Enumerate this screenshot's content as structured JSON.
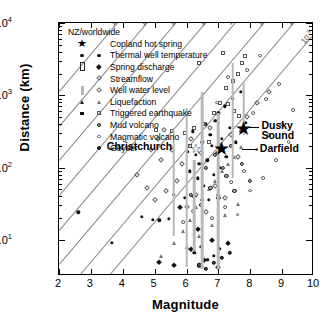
{
  "chart_data": {
    "type": "scatter",
    "title": "",
    "xlabel": "Magnitude",
    "ylabel": "Distance (km)",
    "xlim": [
      2,
      10
    ],
    "ylim_log": [
      0.5,
      4
    ],
    "xscale": "linear",
    "yscale": "log",
    "xticks": [
      "2",
      "3",
      "4",
      "5",
      "6",
      "7",
      "8",
      "9",
      "10"
    ],
    "yticks": [
      "10¹",
      "10²",
      "10³",
      "10⁴"
    ],
    "ytick_exponents": [
      1,
      2,
      3,
      4
    ],
    "grid": false,
    "legend_position": "top-left",
    "legend_title": "NZ/worldwide",
    "legend": [
      {
        "label": "Copland hot spring",
        "nz": "star-filled",
        "world": ""
      },
      {
        "label": "Thermal well temperature",
        "nz": "circle-filled",
        "world": "circle-small-filled"
      },
      {
        "label": "Spring discharge",
        "nz": "bar-open",
        "world": "diamond-filled"
      },
      {
        "label": "Streamflow",
        "nz": "",
        "world": "diamond-open"
      },
      {
        "label": "Well water level",
        "nz": "vertical-bar",
        "world": "diamond-open-light"
      },
      {
        "label": "Liquefaction",
        "nz": "triangle-filled",
        "world": "triangle-open"
      },
      {
        "label": "Triggered earthquake",
        "nz": "square-filled",
        "world": "square-open"
      },
      {
        "label": "Mud volcano",
        "nz": "",
        "world": "circle-shaded"
      },
      {
        "label": "Magmatic volcano",
        "nz": "",
        "world": "circle-open"
      },
      {
        "label": "Geyser",
        "nz": "",
        "world": "circle-dark"
      }
    ],
    "annotations": [
      {
        "text": "Christchurch",
        "x": 5.55,
        "y_log": 2.28,
        "leader": false
      },
      {
        "text": "Dusky Sound",
        "x": 8.35,
        "y_log": 2.55,
        "leader": true
      },
      {
        "text": "Darfield",
        "x": 8.3,
        "y_log": 2.26,
        "leader": true
      }
    ],
    "contour_lines": {
      "description": "Diagonal seismic strain contours, labelled by strain amplitude",
      "labels": [
        "10⁴",
        "10³",
        "10²",
        "10¹",
        "1",
        "10⁻¹",
        "10⁻²",
        "10⁻³"
      ],
      "slope": "log10(distance) increases ~0.52 per magnitude unit"
    },
    "named_events": [
      {
        "name": "Dusky Sound",
        "magnitude": 7.8,
        "distance_km": 340,
        "marker": "star-filled"
      },
      {
        "name": "Darfield",
        "magnitude": 7.1,
        "distance_km": 180,
        "marker": "star-filled"
      },
      {
        "name": "Christchurch",
        "magnitude": 6.3,
        "distance_km": 180,
        "marker": "star-open"
      }
    ],
    "series": [
      {
        "name": "Thermal well temperature",
        "marker": "circle-filled",
        "points": [
          [
            2.6,
            1.38
          ],
          [
            3.65,
            0.96
          ],
          [
            4.6,
            1.32
          ],
          [
            4.95,
            1.28
          ],
          [
            5.15,
            1.27
          ],
          [
            5.45,
            1.29
          ],
          [
            5.6,
            1.62
          ],
          [
            5.95,
            1.58
          ],
          [
            6.05,
            2.22
          ],
          [
            6.1,
            1.95
          ],
          [
            6.2,
            2.5
          ],
          [
            6.3,
            2.18
          ],
          [
            6.35,
            1.85
          ],
          [
            6.4,
            2.05
          ],
          [
            6.5,
            2.35
          ],
          [
            6.55,
            1.75
          ],
          [
            6.6,
            2.6
          ],
          [
            6.65,
            2.1
          ],
          [
            6.7,
            1.55
          ],
          [
            6.75,
            2.45
          ],
          [
            6.8,
            2.3
          ],
          [
            6.85,
            1.9
          ],
          [
            6.9,
            2.65
          ],
          [
            6.95,
            2.2
          ],
          [
            7.0,
            2.75
          ],
          [
            7.05,
            2.0
          ],
          [
            7.1,
            2.4
          ],
          [
            7.2,
            2.85
          ],
          [
            7.25,
            2.15
          ],
          [
            7.35,
            2.55
          ],
          [
            7.45,
            2.95
          ],
          [
            7.55,
            2.35
          ],
          [
            7.7,
            3.05
          ],
          [
            7.85,
            2.62
          ],
          [
            6.25,
            0.82
          ],
          [
            6.45,
            0.9
          ],
          [
            6.65,
            0.72
          ],
          [
            6.85,
            0.78
          ],
          [
            7.05,
            0.88
          ]
        ]
      },
      {
        "name": "Streamflow",
        "marker": "diamond-open",
        "points": [
          [
            4.45,
            1.9
          ],
          [
            4.75,
            1.72
          ],
          [
            5.0,
            1.55
          ],
          [
            5.2,
            2.1
          ],
          [
            5.35,
            1.68
          ],
          [
            5.55,
            2.25
          ],
          [
            5.7,
            1.82
          ],
          [
            5.85,
            2.05
          ],
          [
            6.0,
            1.45
          ],
          [
            6.15,
            2.4
          ],
          [
            6.3,
            1.62
          ],
          [
            6.45,
            2.2
          ],
          [
            6.6,
            1.38
          ],
          [
            6.75,
            2.55
          ],
          [
            6.9,
            1.75
          ],
          [
            7.05,
            2.3
          ],
          [
            7.2,
            1.58
          ],
          [
            7.4,
            2.45
          ],
          [
            7.6,
            2.15
          ],
          [
            7.9,
            2.7
          ],
          [
            8.2,
            2.9
          ],
          [
            8.6,
            3.05
          ],
          [
            5.1,
            2.4
          ],
          [
            4.9,
            2.25
          ],
          [
            5.3,
            2.52
          ]
        ]
      },
      {
        "name": "Magmatic volcano",
        "marker": "circle-open",
        "points": [
          [
            5.9,
            1.25
          ],
          [
            6.2,
            1.4
          ],
          [
            6.5,
            1.55
          ],
          [
            6.8,
            1.3
          ],
          [
            7.0,
            1.62
          ],
          [
            7.2,
            1.45
          ],
          [
            7.4,
            1.8
          ],
          [
            7.6,
            1.35
          ],
          [
            7.8,
            1.95
          ],
          [
            8.0,
            1.68
          ],
          [
            8.2,
            2.25
          ],
          [
            8.4,
            1.85
          ],
          [
            8.6,
            2.45
          ],
          [
            8.8,
            2.1
          ],
          [
            9.0,
            2.6
          ],
          [
            9.2,
            2.35
          ],
          [
            8.1,
            2.75
          ],
          [
            8.5,
            2.95
          ],
          [
            8.9,
            3.15
          ],
          [
            7.9,
            3.35
          ],
          [
            8.3,
            3.55
          ],
          [
            7.3,
            3.25
          ],
          [
            7.7,
            2.5
          ],
          [
            6.95,
            2.9
          ],
          [
            9.35,
            2.8
          ]
        ]
      },
      {
        "name": "Triggered earthquake",
        "marker": "square-open",
        "points": [
          [
            5.05,
            2.52
          ],
          [
            5.55,
            2.5
          ],
          [
            5.95,
            2.48
          ],
          [
            6.25,
            2.55
          ],
          [
            6.55,
            2.6
          ],
          [
            6.85,
            2.75
          ],
          [
            7.05,
            2.9
          ],
          [
            7.25,
            3.1
          ],
          [
            7.45,
            3.2
          ],
          [
            7.6,
            3.3
          ],
          [
            7.75,
            3.45
          ],
          [
            7.85,
            3.55
          ],
          [
            6.4,
            3.45
          ],
          [
            7.15,
            3.58
          ],
          [
            7.3,
            2.88
          ],
          [
            7.5,
            2.78
          ],
          [
            7.65,
            2.72
          ],
          [
            6.7,
            2.35
          ],
          [
            6.1,
            2.3
          ]
        ]
      },
      {
        "name": "Liquefaction",
        "marker": "triangle-open",
        "points": [
          [
            5.2,
            0.78
          ],
          [
            5.6,
            0.95
          ],
          [
            5.9,
            1.12
          ],
          [
            6.1,
            1.28
          ],
          [
            6.3,
            1.45
          ],
          [
            6.5,
            1.58
          ],
          [
            6.7,
            1.7
          ],
          [
            6.9,
            1.82
          ],
          [
            7.1,
            1.95
          ],
          [
            7.3,
            2.05
          ],
          [
            7.5,
            2.15
          ],
          [
            7.7,
            2.28
          ],
          [
            6.0,
            0.9
          ],
          [
            6.4,
            1.05
          ],
          [
            6.8,
            1.2
          ],
          [
            7.2,
            1.35
          ],
          [
            7.6,
            1.5
          ]
        ]
      },
      {
        "name": "Mud volcano",
        "marker": "circle-shaded",
        "points": [
          [
            6.15,
            1.62
          ],
          [
            6.45,
            1.48
          ],
          [
            6.75,
            1.72
          ],
          [
            7.0,
            1.58
          ],
          [
            7.25,
            1.88
          ],
          [
            7.5,
            1.68
          ],
          [
            7.75,
            2.05
          ],
          [
            8.0,
            1.82
          ],
          [
            6.6,
            2.0
          ],
          [
            6.9,
            2.18
          ],
          [
            7.15,
            2.0
          ],
          [
            7.4,
            2.3
          ]
        ]
      },
      {
        "name": "Spring discharge",
        "marker": "diamond-filled",
        "points": [
          [
            5.15,
            0.7
          ],
          [
            5.6,
            0.65
          ],
          [
            6.15,
            0.88
          ],
          [
            6.35,
            1.15
          ],
          [
            6.55,
            0.72
          ],
          [
            6.8,
            1.0
          ],
          [
            7.0,
            0.62
          ],
          [
            6.25,
            1.6
          ],
          [
            5.8,
            1.45
          ],
          [
            7.3,
            0.95
          ]
        ]
      },
      {
        "name": "Geyser",
        "marker": "circle-dark",
        "points": [
          [
            6.6,
            0.6
          ],
          [
            6.85,
            0.68
          ],
          [
            7.1,
            0.75
          ],
          [
            7.35,
            0.82
          ],
          [
            6.4,
            0.65
          ]
        ]
      },
      {
        "name": "Well water level (bars)",
        "marker": "vertical-bar",
        "bars": [
          [
            5.6,
            1.05,
            2.55
          ],
          [
            6.0,
            0.62,
            2.82
          ],
          [
            6.5,
            0.6,
            3.05
          ],
          [
            7.0,
            0.6,
            2.75
          ],
          [
            7.45,
            1.85,
            3.45
          ],
          [
            7.8,
            2.45,
            3.2
          ],
          [
            6.25,
            0.85,
            2.1
          ]
        ]
      }
    ]
  }
}
